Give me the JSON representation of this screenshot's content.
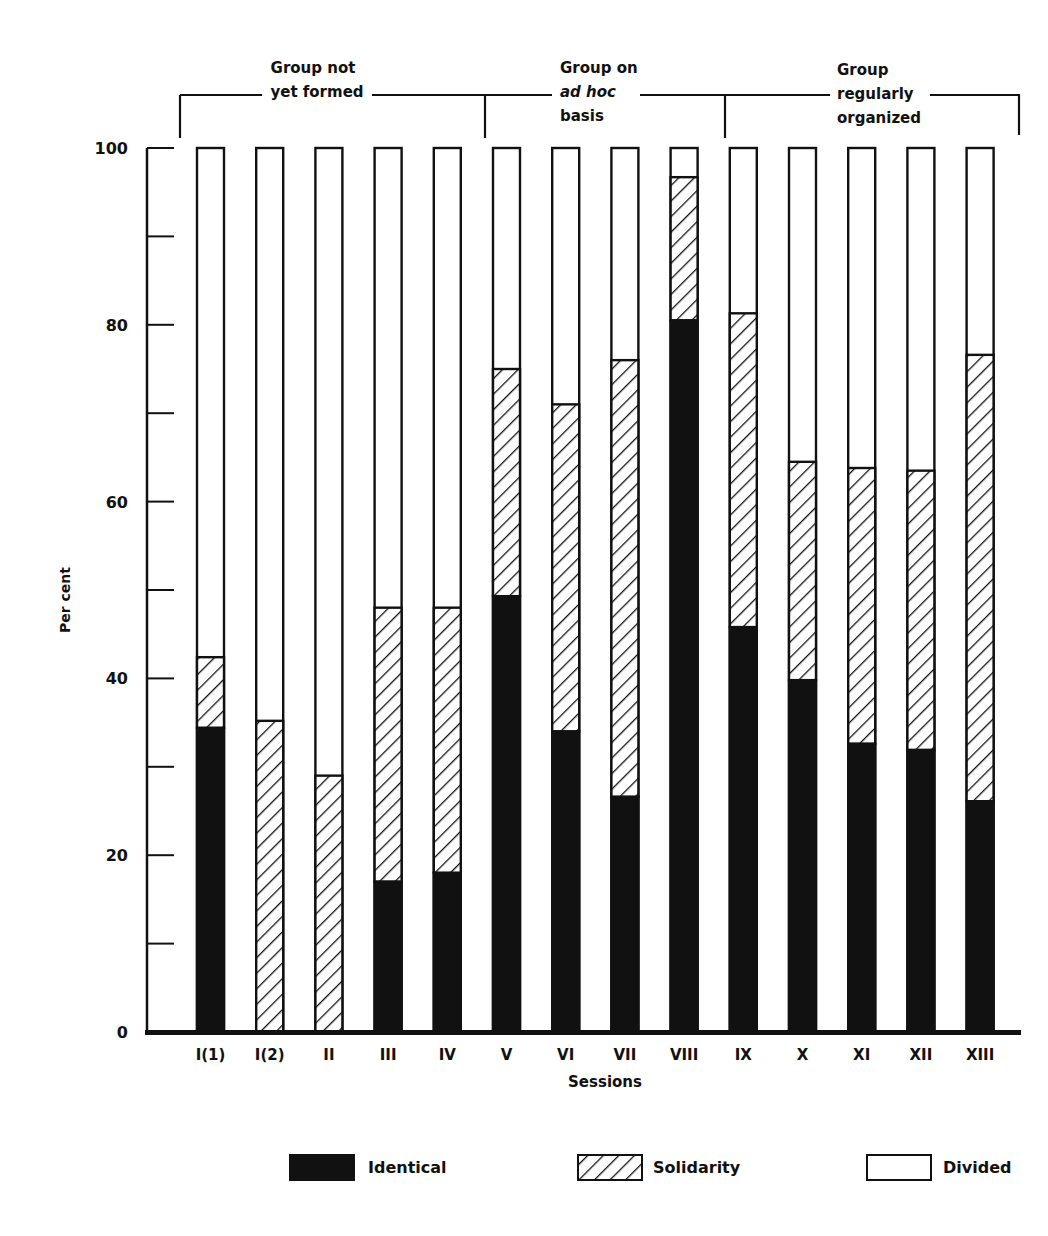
{
  "chart_data": {
    "type": "bar",
    "stacked": true,
    "title": "",
    "xlabel": "Sessions",
    "ylabel": "Per cent",
    "ylim": [
      0,
      100
    ],
    "yticks_labeled": [
      0,
      20,
      40,
      60,
      80,
      100
    ],
    "yticks_minor": [
      10,
      30,
      50,
      70,
      90
    ],
    "grid": false,
    "legend_position": "bottom",
    "categories": [
      "I(1)",
      "I(2)",
      "II",
      "III",
      "IV",
      "V",
      "VI",
      "VII",
      "VIII",
      "IX",
      "X",
      "XI",
      "XII",
      "XIII"
    ],
    "series": [
      {
        "name": "Identical",
        "fill": "solid-black",
        "values": [
          34.4,
          0,
          0,
          17,
          18,
          49.3,
          34,
          26.6,
          80.5,
          45.8,
          39.8,
          32.6,
          31.9,
          26.1
        ]
      },
      {
        "name": "Solidarity",
        "fill": "diagonal-hatch",
        "values": [
          8.0,
          35.2,
          29,
          31,
          30,
          25.7,
          37,
          49.4,
          16.2,
          35.5,
          24.7,
          31.2,
          31.6,
          50.5
        ]
      },
      {
        "name": "Divided",
        "fill": "white",
        "values": [
          57.6,
          64.8,
          71,
          52,
          52,
          25,
          29,
          24,
          3.3,
          18.7,
          35.5,
          36.2,
          36.5,
          23.4
        ]
      }
    ],
    "cumulative_top_of_solidarity": [
      42.4,
      35.2,
      29,
      48,
      48,
      75,
      71,
      76,
      96.7,
      81.3,
      64.5,
      63.8,
      63.5,
      76.6
    ],
    "group_annotations": [
      {
        "label_lines": [
          "Group not",
          "yet formed"
        ],
        "spans": [
          "I(1)",
          "IV"
        ]
      },
      {
        "label_lines": [
          "Group on",
          "ad hoc",
          "basis"
        ],
        "spans": [
          "V",
          "VIII"
        ]
      },
      {
        "label_lines": [
          "Group",
          "regularly",
          "organized"
        ],
        "spans": [
          "IX",
          "XIII"
        ]
      }
    ]
  },
  "axis": {
    "y_label": "Per cent",
    "x_label": "Sessions",
    "y_tick_labels": [
      "0",
      "20",
      "40",
      "60",
      "80",
      "100"
    ]
  },
  "groups": {
    "g1": {
      "line1": "Group not",
      "line2": "yet formed"
    },
    "g2": {
      "line1": "Group on",
      "line2": "ad hoc",
      "line3": "basis"
    },
    "g3": {
      "line1": "Group",
      "line2": "regularly",
      "line3": "organized"
    }
  },
  "legend": {
    "identical": "Identical",
    "solidarity": "Solidarity",
    "divided": "Divided"
  },
  "colors": {
    "ink": "#111111",
    "paper": "#ffffff"
  }
}
